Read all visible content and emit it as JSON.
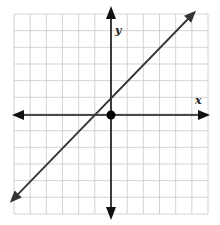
{
  "chart_data": {
    "type": "line",
    "title": "",
    "xlabel": "x",
    "ylabel": "y",
    "xlim": [
      -6,
      6
    ],
    "ylim": [
      -6,
      6
    ],
    "grid": true,
    "grid_step": 1,
    "series": [
      {
        "name": "y = x + 1",
        "slope": 1,
        "intercept": 1,
        "x": [
          -6,
          5
        ],
        "y": [
          -5,
          6
        ],
        "arrows_both_ends": true
      }
    ],
    "points": [
      {
        "label": "origin",
        "x": 0,
        "y": 0
      }
    ],
    "annotations": [
      "x-intercept at (-1, 0)",
      "y-intercept at (0, 1)"
    ]
  },
  "axes": {
    "x_label": "x",
    "y_label": "y"
  },
  "colors": {
    "grid": "#c8c8c8",
    "axis": "#111111",
    "line": "#333333",
    "point": "#000000"
  }
}
